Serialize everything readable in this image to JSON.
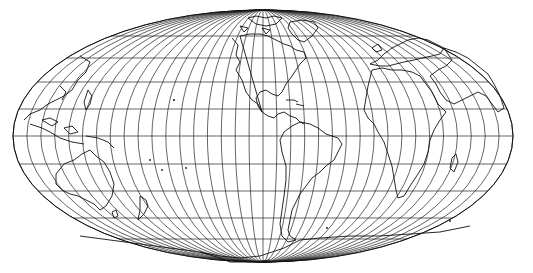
{
  "map": {
    "projection": "elliptical world projection with curved meridians and straight parallels",
    "graticule_spacing_deg": 10,
    "center_x": 263,
    "center_y": 136,
    "radius_x": 250,
    "radius_y": 126,
    "line_color": "#111111",
    "background": "#ffffff",
    "parallels_y": [
      36,
      58,
      82,
      109,
      136,
      164,
      191,
      218,
      239
    ],
    "meridian_count": 36,
    "continents": [
      "North America",
      "South America",
      "Europe",
      "Africa",
      "Asia",
      "Australia",
      "Antarctica",
      "Greenland"
    ]
  }
}
